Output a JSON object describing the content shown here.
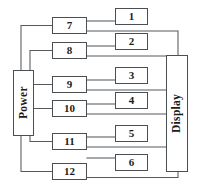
{
  "diagram": {
    "type": "block-diagram",
    "stroke_color": "#555a5e",
    "box_border_color": "#4a4f54",
    "background_color": "#ffffff",
    "blocks": {
      "power": {
        "label": "Power",
        "x": 13,
        "y": 70,
        "w": 21,
        "h": 66
      },
      "display": {
        "label": "Display",
        "x": 166,
        "y": 55,
        "w": 22,
        "h": 117
      }
    },
    "middle_column": [
      {
        "label": "7",
        "x": 52,
        "y": 17,
        "w": 35,
        "h": 17
      },
      {
        "label": "8",
        "x": 52,
        "y": 42,
        "w": 35,
        "h": 17
      },
      {
        "label": "9",
        "x": 52,
        "y": 76,
        "w": 35,
        "h": 17
      },
      {
        "label": "10",
        "x": 52,
        "y": 100,
        "w": 35,
        "h": 17
      },
      {
        "label": "11",
        "x": 52,
        "y": 133,
        "w": 35,
        "h": 17
      },
      {
        "label": "12",
        "x": 52,
        "y": 163,
        "w": 35,
        "h": 17
      }
    ],
    "right_column": [
      {
        "label": "1",
        "x": 115,
        "y": 8,
        "w": 33,
        "h": 17
      },
      {
        "label": "2",
        "x": 115,
        "y": 33,
        "w": 33,
        "h": 17
      },
      {
        "label": "3",
        "x": 115,
        "y": 67,
        "w": 33,
        "h": 17
      },
      {
        "label": "4",
        "x": 115,
        "y": 92,
        "w": 33,
        "h": 17
      },
      {
        "label": "5",
        "x": 115,
        "y": 125,
        "w": 33,
        "h": 17
      },
      {
        "label": "6",
        "x": 115,
        "y": 154,
        "w": 33,
        "h": 17
      }
    ],
    "wires": [
      {
        "name": "power-to-7",
        "d": "M 52 25.5 L 21 25.5 L 21 70"
      },
      {
        "name": "power-to-8",
        "d": "M 52 50.5 L 30 50.5 L 30 70"
      },
      {
        "name": "power-to-9",
        "d": "M 34 84.5 L 52 84.5"
      },
      {
        "name": "power-to-10",
        "d": "M 34 108.5 L 52 108.5"
      },
      {
        "name": "power-to-11",
        "d": "M 52 141.5 L 30 141.5 L 30 136"
      },
      {
        "name": "power-to-12",
        "d": "M 52 171.5 L 21 171.5 L 21 136"
      },
      {
        "name": "n7-to-1",
        "d": "M 87 21 L 115 21"
      },
      {
        "name": "n8-to-2",
        "d": "M 87 46 L 115 46"
      },
      {
        "name": "n9-to-3",
        "d": "M 87 80 L 115 80"
      },
      {
        "name": "n10-to-4",
        "d": "M 87 104 L 115 104"
      },
      {
        "name": "n11-to-5",
        "d": "M 87 137 L 115 137"
      },
      {
        "name": "n12-to-6",
        "d": "M 87 158 L 115 158"
      },
      {
        "name": "n7-to-display",
        "d": "M 87 31 L 178 31 L 178 55"
      },
      {
        "name": "n8-to-display",
        "d": "M 87 56 L 166 56"
      },
      {
        "name": "n9-to-display",
        "d": "M 87 90 L 166 90"
      },
      {
        "name": "n10-to-display",
        "d": "M 87 114 L 166 114"
      },
      {
        "name": "n11-to-display",
        "d": "M 87 147 L 166 147"
      },
      {
        "name": "n12-to-display",
        "d": "M 87 177.5 L 178 177.5 L 178 172"
      }
    ]
  }
}
